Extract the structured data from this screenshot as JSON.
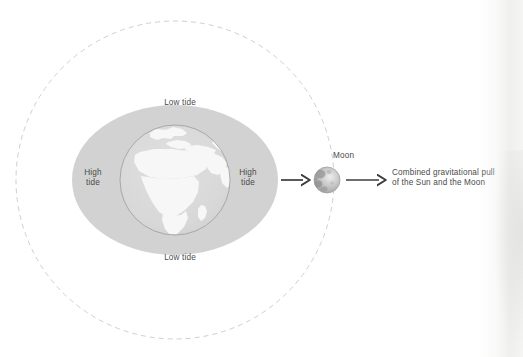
{
  "diagram": {
    "labels": {
      "low_tide_top": "Low tide",
      "low_tide_bottom": "Low tide",
      "high_tide_left": "High\ntide",
      "high_tide_left_line1": "High",
      "high_tide_left_line2": "tide",
      "high_tide_right_line1": "High",
      "high_tide_right_line2": "tide",
      "moon": "Moon",
      "combined_pull_line1": "Combined gravitational pull",
      "combined_pull_line2": "of the Sun and the Moon"
    },
    "bodies": {
      "earth": {
        "name": "Earth",
        "center_x": 175,
        "center_y": 180,
        "radius": 55
      },
      "moon": {
        "name": "Moon",
        "center_x": 327,
        "center_y": 180,
        "radius": 13
      },
      "tidal_bulge": {
        "name": "tidal-bulge-ellipse",
        "center_x": 175,
        "center_y": 180,
        "radius_x": 103,
        "radius_y": 75
      },
      "moon_orbit": {
        "name": "moon-orbit",
        "center_x": 175,
        "center_y": 180,
        "radius": 159,
        "style": "dashed"
      }
    },
    "arrows": [
      {
        "name": "arrow-earth-to-moon",
        "x1": 281,
        "y1": 180,
        "x2": 308,
        "y2": 180
      },
      {
        "name": "arrow-moon-to-caption",
        "x1": 346,
        "y1": 180,
        "x2": 384,
        "y2": 180
      }
    ],
    "colors": {
      "background": "#ffffff",
      "tidal_bulge_fill": "#d2d2d2",
      "earth_ocean": "#d9d9d9",
      "earth_land": "#f7f7f7",
      "earth_outline": "#9a9a9a",
      "orbit_dash": "#cfcfcf",
      "arrow": "#3c3c3c",
      "text": "#4a4a4a",
      "moon_base": "#b9b9b9",
      "moon_dark": "#8f8f8f",
      "moon_light": "#e4e4e4"
    }
  }
}
